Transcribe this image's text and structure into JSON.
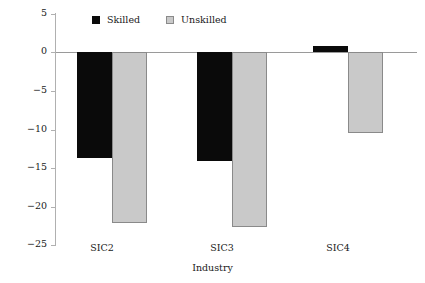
{
  "chart_data": {
    "type": "bar",
    "title": "",
    "xlabel": "Industry",
    "ylabel": "Percentage",
    "categories": [
      "SIC2",
      "SIC3",
      "SIC4"
    ],
    "series": [
      {
        "name": "Skilled",
        "color": "#0a0a0a",
        "values": [
          -13.7,
          -14.0,
          0.7
        ]
      },
      {
        "name": "Unskilled",
        "color": "#c9c9c9",
        "values": [
          -22.1,
          -22.5,
          -10.5
        ]
      }
    ],
    "ylim": [
      -25,
      5
    ],
    "yticks": [
      5,
      0,
      -5,
      -10,
      -15,
      -20,
      -25
    ],
    "ytick_labels": [
      "5",
      "0",
      "−5",
      "−10",
      "−15",
      "−20",
      "−25"
    ],
    "grid": false,
    "legend_position": "top-center"
  },
  "legend": {
    "items": [
      {
        "label": "Skilled",
        "swatch": "black-square-swatch"
      },
      {
        "label": "Unskilled",
        "swatch": "gray-square-swatch"
      }
    ]
  },
  "axes": {
    "y_title": "Percentage",
    "x_title": "Industry"
  }
}
